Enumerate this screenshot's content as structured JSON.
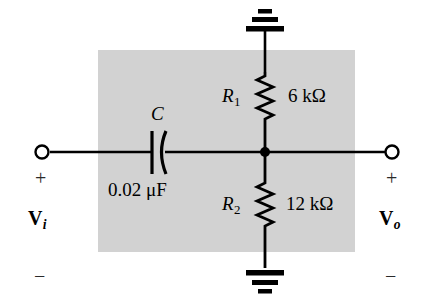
{
  "figure": {
    "type": "electrical-schematic",
    "background_color": "#ffffff",
    "shaded_box_color": "#d2d2d2",
    "line_color": "#000000"
  },
  "components": {
    "capacitor": {
      "designator": "C",
      "value": "0.02 μF",
      "style": "curved-plate"
    },
    "resistor_top": {
      "designator": "R",
      "designator_subscript": "1",
      "value": "6 kΩ"
    },
    "resistor_bottom": {
      "designator": "R",
      "designator_subscript": "2",
      "value": "12 kΩ"
    },
    "ground_top": {
      "name": "ground-symbol-top",
      "orientation": "up"
    },
    "ground_bottom": {
      "name": "ground-symbol-bottom",
      "orientation": "down"
    },
    "junction_node": {
      "name": "junction-dot"
    }
  },
  "ports": {
    "input": {
      "label": "V",
      "label_subscript": "i",
      "polarity_positive": "+",
      "polarity_negative": "−",
      "terminal": "open-circle"
    },
    "output": {
      "label": "V",
      "label_subscript": "o",
      "polarity_positive": "+",
      "polarity_negative": "−",
      "terminal": "open-circle"
    }
  }
}
